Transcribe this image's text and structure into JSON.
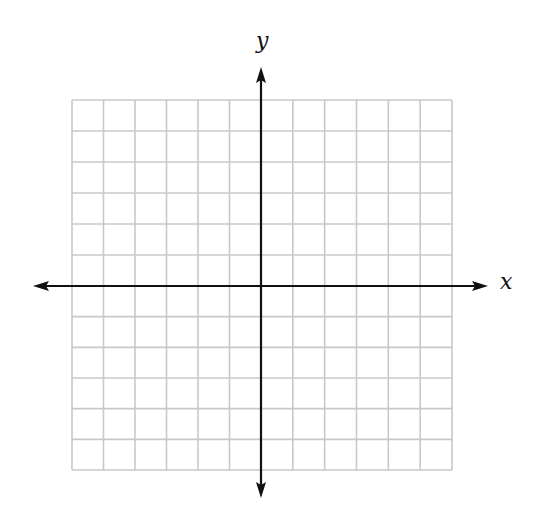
{
  "diagram": {
    "type": "coordinate-plane",
    "x_axis_label": "x",
    "y_axis_label": "y",
    "grid": {
      "columns": 12,
      "rows": 12,
      "left": 72,
      "top": 100,
      "right": 452,
      "bottom": 470,
      "line_color": "#c8c8c8"
    },
    "origin": {
      "x": 261,
      "y": 286
    },
    "axes": {
      "color": "#111111",
      "x_start": 33,
      "x_end": 488,
      "y_start": 67,
      "y_end": 498
    }
  }
}
